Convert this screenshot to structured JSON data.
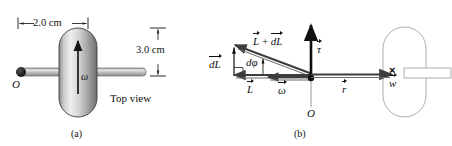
{
  "figure": {
    "background_color": "#ffffff",
    "ink_color": "#111111"
  },
  "panel_a": {
    "caption": "(a)",
    "view_label": "Top view",
    "width_dimension": "2.0 cm",
    "height_dimension": "3.0 cm",
    "origin_label": "O",
    "spin_label": "ω",
    "wheel": {
      "shape": "rounded-rectangle",
      "fill": "gradient-gray",
      "gradient_light": "#f2f2f2",
      "gradient_dark": "#6e6e6e",
      "stroke": "#3a3a3a"
    },
    "rod": {
      "shape": "horizontal-cylinder",
      "fill": "gradient-gray",
      "stroke": "#5a5a5a"
    }
  },
  "panel_b": {
    "caption": "(b)",
    "origin_label": "O",
    "vectors": [
      {
        "name": "dL",
        "label": "dL",
        "accent": "arrow-overbar"
      },
      {
        "name": "L-plus-dL",
        "label_part1": "L",
        "label_plus": "+",
        "label_part2": "dL",
        "accent": "arrow-overbar"
      },
      {
        "name": "L",
        "label": "L",
        "accent": "arrow-overbar"
      },
      {
        "name": "omega",
        "label": "ω",
        "accent": "arrow-overbar"
      },
      {
        "name": "tau",
        "label": "τ",
        "accent": "arrow-overbar"
      },
      {
        "name": "r",
        "label": "r",
        "accent": "arrow-overbar"
      },
      {
        "name": "w",
        "label": "w",
        "accent": "arrow-overbar"
      }
    ],
    "angle_label": "dφ",
    "into_page_symbol": "×",
    "wheel": {
      "shape": "rounded-rectangle",
      "fill": "none",
      "stroke": "#9a9a9a"
    },
    "rod": {
      "shape": "horizontal-rectangle",
      "fill": "none",
      "stroke": "#9a9a9a"
    }
  }
}
